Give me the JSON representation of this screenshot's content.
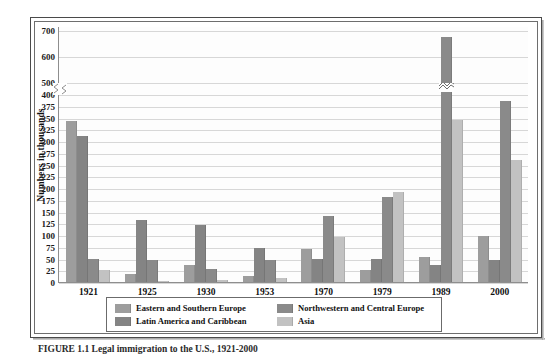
{
  "figure": {
    "caption": "FIGURE 1.1  Legal immigration to the U.S., 1921-2000",
    "y_axis_title": "Numbers in thousands"
  },
  "legend": {
    "items": [
      {
        "label": "Eastern and Southern Europe",
        "color": "#9d9d9d",
        "swatch_name": "legend-swatch-eastern-southern-europe"
      },
      {
        "label": "Northwestern and Central Europe",
        "color": "#8a8a8a",
        "swatch_name": "legend-swatch-northwestern-central-europe"
      },
      {
        "label": "Latin America and Caribbean",
        "color": "#848484",
        "swatch_name": "legend-swatch-latin-america-caribbean"
      },
      {
        "label": "Asia",
        "color": "#c2c2c2",
        "swatch_name": "legend-swatch-asia"
      }
    ]
  },
  "chart_data": {
    "type": "bar",
    "title": "",
    "xlabel": "",
    "ylabel": "Numbers in thousands",
    "grid": true,
    "legend_position": "bottom",
    "axis_break": {
      "between": [
        400,
        500
      ],
      "note": "y-axis scale break between 400 and 500"
    },
    "ylim": [
      0,
      700
    ],
    "yticks": [
      0,
      25,
      50,
      75,
      100,
      125,
      150,
      175,
      200,
      225,
      250,
      275,
      300,
      325,
      350,
      375,
      400,
      500,
      600,
      700
    ],
    "categories": [
      "1921",
      "1925",
      "1930",
      "1953",
      "1970",
      "1979",
      "1989",
      "2000"
    ],
    "series": [
      {
        "name": "Eastern and Southern Europe",
        "color": "#9d9d9d",
        "values": [
          342,
          16,
          37,
          13,
          71,
          25,
          54,
          97
        ]
      },
      {
        "name": "Latin America and Caribbean",
        "color": "#848484",
        "values": [
          310,
          132,
          122,
          72,
          50,
          50,
          36,
          46
        ]
      },
      {
        "name": "Northwestern and Central Europe",
        "color": "#8a8a8a",
        "values": [
          50,
          46,
          28,
          47,
          140,
          180,
          675,
          385
        ]
      },
      {
        "name": "Asia",
        "color": "#c2c2c2",
        "values": [
          26,
          3,
          4,
          8,
          95,
          192,
          345,
          260
        ]
      }
    ]
  }
}
